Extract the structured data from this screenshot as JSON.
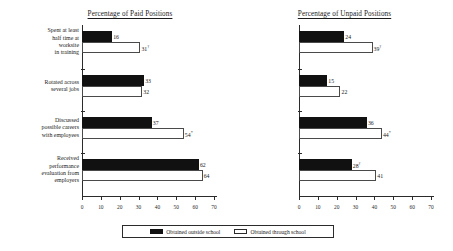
{
  "chart_data": {
    "type": "bar",
    "orientation": "horizontal",
    "title": "",
    "xlabel": "",
    "ylabel": "",
    "xlim": [
      0,
      70
    ],
    "xticks": [
      0,
      10,
      20,
      30,
      40,
      50,
      60,
      70
    ],
    "grid": false,
    "legend_position": "bottom",
    "categories": [
      "Spent at least half time at worksite in training",
      "Rotated across several jobs",
      "Discussed possible careers with employees",
      "Received performance evaluation from employers"
    ],
    "category_label_lines": [
      [
        "Spent at least",
        "half time at",
        "worksite",
        "in training"
      ],
      [
        "Rotated across",
        "several jobs"
      ],
      [
        "Discussed",
        "possible careers",
        "with employees"
      ],
      [
        "Received",
        "performance",
        "evaluation from",
        "employers"
      ]
    ],
    "legend": [
      {
        "name": "Obtained outside school",
        "color": "#111111",
        "fill": "solid"
      },
      {
        "name": "Obtained through school",
        "color": "#ffffff",
        "fill": "outline"
      }
    ],
    "panels": [
      {
        "id": "paid",
        "title": "Percentage of Paid Positions",
        "series": [
          {
            "name": "Obtained outside school",
            "values": [
              16,
              33,
              37,
              62
            ],
            "labels": [
              "16",
              "33",
              "37",
              "62"
            ],
            "marks": [
              "",
              "",
              "",
              ""
            ]
          },
          {
            "name": "Obtained through school",
            "values": [
              31,
              32,
              54,
              64
            ],
            "labels": [
              "31",
              "32",
              "54",
              "64"
            ],
            "marks": [
              "†",
              "",
              "*",
              ""
            ]
          }
        ]
      },
      {
        "id": "unpaid",
        "title": "Percentage of Unpaid Positions",
        "series": [
          {
            "name": "Obtained outside school",
            "values": [
              24,
              15,
              36,
              28
            ],
            "labels": [
              "24",
              "15",
              "36",
              "28"
            ],
            "marks": [
              "",
              "",
              "",
              "†"
            ]
          },
          {
            "name": "Obtained through school",
            "values": [
              39,
              22,
              44,
              41
            ],
            "labels": [
              "39",
              "22",
              "44",
              "41"
            ],
            "marks": [
              "†",
              "",
              "*",
              ""
            ]
          }
        ]
      }
    ]
  }
}
